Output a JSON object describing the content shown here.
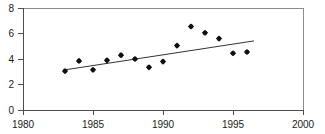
{
  "chart_data": {
    "type": "scatter",
    "title": "",
    "subtitle": "",
    "xlabel": "",
    "ylabel": "",
    "xlim": [
      1980,
      2000
    ],
    "ylim": [
      0,
      8
    ],
    "xticks": [
      1980,
      1985,
      1990,
      1995,
      2000
    ],
    "yticks": [
      0,
      2,
      4,
      6,
      8
    ],
    "xtick_labels": [
      "1980",
      "1985",
      "1990",
      "1995",
      "2000"
    ],
    "ytick_labels": [
      "0",
      "2",
      "4",
      "6",
      "8"
    ],
    "grid": false,
    "legend": null,
    "marker_style": "filled-diamond",
    "marker_color": "#111111",
    "trend_color": "#333333",
    "axis_color": "#4d4d4d",
    "frame_color": "#8c8c8c",
    "x": [
      1983,
      1984,
      1985,
      1986,
      1987,
      1988,
      1989,
      1990,
      1991,
      1992,
      1993,
      1994,
      1995,
      1996
    ],
    "values": [
      3.05,
      3.85,
      3.15,
      3.9,
      4.3,
      4.0,
      3.35,
      3.8,
      5.05,
      6.55,
      6.05,
      5.6,
      4.45,
      4.55
    ],
    "series": [
      {
        "name": "observations",
        "x": [
          1983,
          1984,
          1985,
          1986,
          1987,
          1988,
          1989,
          1990,
          1991,
          1992,
          1993,
          1994,
          1995,
          1996
        ],
        "values": [
          3.05,
          3.85,
          3.15,
          3.9,
          4.3,
          4.0,
          3.35,
          3.8,
          5.05,
          6.55,
          6.05,
          5.6,
          4.45,
          4.55
        ],
        "type": "scatter"
      },
      {
        "name": "trend",
        "x": [
          1983.0,
          1996.5
        ],
        "values": [
          3.15,
          5.42
        ],
        "type": "line"
      }
    ],
    "annotations": []
  }
}
